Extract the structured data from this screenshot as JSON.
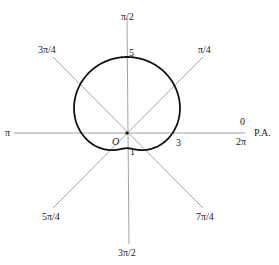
{
  "diagram": {
    "title": "",
    "curve": "r = 3 + 2 sin θ",
    "axis_labels": {
      "pi_over_2": "π/2",
      "three_pi_over_4": "3π/4",
      "pi_over_4": "π/4",
      "pi": "π",
      "zero": "0",
      "two_pi": "2π",
      "polar_axis": "P.A.",
      "five_pi_over_4": "5π/4",
      "three_pi_over_2": "3π/2",
      "seven_pi_over_4": "7π/4"
    },
    "point_labels": {
      "origin": "O",
      "r_top": "5",
      "r_right": "3",
      "r_bottom": "1"
    },
    "colors": {
      "curve": "#111111",
      "axes": "#888888",
      "text": "#222222"
    }
  }
}
